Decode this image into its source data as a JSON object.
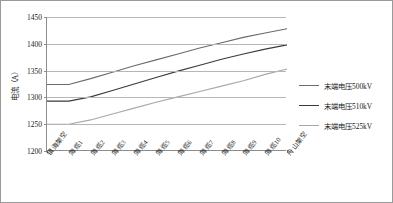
{
  "chart_data": {
    "type": "line",
    "title": "",
    "xlabel": "",
    "ylabel": "电流（A）",
    "ylim": [
      1200,
      1450
    ],
    "ytick_labels": [
      "1450",
      "1400",
      "1350",
      "1300",
      "1250",
      "1200"
    ],
    "ytick_values": [
      1450,
      1400,
      1350,
      1300,
      1250,
      1200
    ],
    "grid": true,
    "legend_position": "right",
    "categories": [
      "镇海架空",
      "海缆1",
      "海缆2",
      "海缆3",
      "海缆4",
      "海缆5",
      "海缆6",
      "海缆7",
      "海缆8",
      "海缆9",
      "海缆10",
      "舟山架空"
    ],
    "series": [
      {
        "name": "末端电压500kV",
        "color": "#6b6b6b",
        "values": [
          1324,
          1324,
          1335,
          1347,
          1359,
          1370,
          1381,
          1392,
          1402,
          1412,
          1420,
          1428
        ]
      },
      {
        "name": "末端电压510kV",
        "color": "#3a3a3a",
        "values": [
          1293,
          1293,
          1301,
          1313,
          1325,
          1337,
          1349,
          1360,
          1371,
          1381,
          1390,
          1398
        ]
      },
      {
        "name": "末端电压525kV",
        "color": "#a8a8a8",
        "values": [
          1250,
          1250,
          1258,
          1269,
          1280,
          1291,
          1301,
          1311,
          1321,
          1331,
          1343,
          1353
        ]
      }
    ]
  },
  "legend": {
    "items": [
      {
        "label": "末端电压500kV"
      },
      {
        "label": "末端电压510kV"
      },
      {
        "label": "末端电压525kV"
      }
    ]
  }
}
